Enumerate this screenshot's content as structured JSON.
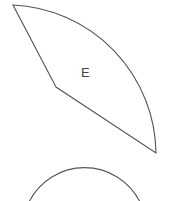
{
  "diagram": {
    "shapes": [
      {
        "id": "sector-e",
        "type": "circular-sector",
        "label": "E",
        "vertices": {
          "top_left": [
            13,
            5
          ],
          "inner": [
            56,
            87
          ],
          "bottom_right": [
            156,
            153
          ]
        },
        "stroke": "#555555"
      },
      {
        "id": "partial-circle",
        "type": "arc",
        "label": "",
        "stroke": "#555555"
      }
    ]
  }
}
